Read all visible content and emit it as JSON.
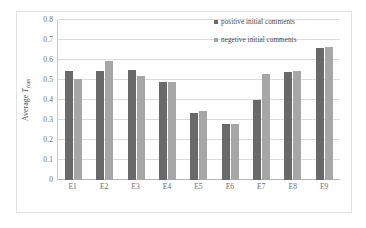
{
  "chart_data": {
    "type": "bar",
    "title": "",
    "xlabel": "",
    "ylabel": "Average T_com",
    "ylabel_parts": {
      "prefix": "Average ",
      "symbol": "T",
      "subscript": "com"
    },
    "categories": [
      "E1",
      "E2",
      "E3",
      "E4",
      "E5",
      "E6",
      "E7",
      "E8",
      "E9"
    ],
    "series": [
      {
        "name": "positive initial comments",
        "color": "#696969",
        "values": [
          0.543,
          0.547,
          0.549,
          0.489,
          0.333,
          0.278,
          0.399,
          0.542,
          0.659
        ]
      },
      {
        "name": "negetive initial comments",
        "color": "#a6a6a6",
        "values": [
          0.505,
          0.594,
          0.519,
          0.489,
          0.343,
          0.281,
          0.53,
          0.545,
          0.667
        ]
      }
    ],
    "ylim": [
      0,
      0.8
    ],
    "ytick_values": [
      0,
      0.1,
      0.2,
      0.3,
      0.4,
      0.5,
      0.6,
      0.7,
      0.8
    ],
    "ytick_labels": [
      "0",
      "0.1",
      "0.2",
      "0.3",
      "0.4",
      "0.5",
      "0.6",
      "0.7",
      "0.8"
    ],
    "grid": true,
    "grid_axis": "y",
    "legend_position": "top-right",
    "background_color": "#ffffff",
    "gridline_color": "#dcdcdc",
    "frame_color": "#e2e2e2"
  }
}
